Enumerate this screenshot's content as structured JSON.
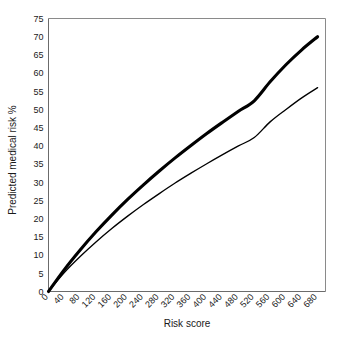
{
  "chart_data": {
    "type": "line",
    "title": "",
    "subtitle": "",
    "xlabel": "Risk score",
    "ylabel": "Predicted medical risk %",
    "xlim": [
      0,
      700
    ],
    "ylim": [
      0,
      75
    ],
    "grid": false,
    "legend": "none",
    "legend_position": "none",
    "xticks": [
      0,
      40,
      80,
      120,
      160,
      200,
      240,
      280,
      320,
      360,
      400,
      440,
      480,
      520,
      560,
      600,
      640,
      680
    ],
    "xtick_labels": [
      "0",
      "40",
      "80",
      "120",
      "160",
      "200",
      "240",
      "280",
      "320",
      "360",
      "400",
      "440",
      "480",
      "520",
      "560",
      "600",
      "640",
      "680"
    ],
    "xtick_rotation_deg": 45,
    "yticks": [
      0,
      5,
      10,
      15,
      20,
      25,
      30,
      35,
      40,
      45,
      50,
      55,
      60,
      65,
      70,
      75
    ],
    "ytick_labels": [
      "0",
      "5",
      "10",
      "15",
      "20",
      "25",
      "30",
      "35",
      "40",
      "45",
      "50",
      "55",
      "60",
      "65",
      "70",
      "75"
    ],
    "x": [
      0,
      40,
      80,
      120,
      160,
      200,
      240,
      280,
      320,
      360,
      400,
      440,
      480,
      520,
      560,
      600,
      640,
      680
    ],
    "series": [
      {
        "name": "upper-curve",
        "style": "thick-solid",
        "color": "#000000",
        "line_width_px": 3.1,
        "values": [
          0,
          6.0,
          11.4,
          16.4,
          21.0,
          25.3,
          29.3,
          33.1,
          36.7,
          40.1,
          43.4,
          46.5,
          49.5,
          52.4,
          57.6,
          62.3,
          66.4,
          70.0
        ]
      },
      {
        "name": "lower-curve",
        "style": "thin-solid",
        "color": "#000000",
        "line_width_px": 1.35,
        "values": [
          0,
          5.2,
          9.6,
          13.6,
          17.3,
          20.7,
          23.9,
          26.9,
          29.8,
          32.5,
          35.1,
          37.6,
          40.0,
          42.3,
          46.6,
          50.0,
          53.2,
          56.0
        ]
      }
    ]
  },
  "axes": {
    "x_title": "Risk score",
    "y_title": "Predicted medical risk %"
  },
  "colors": {
    "background": "#ffffff",
    "curve": "#000000",
    "frame": "#8a8a8a",
    "text": "#1a1a1a"
  }
}
